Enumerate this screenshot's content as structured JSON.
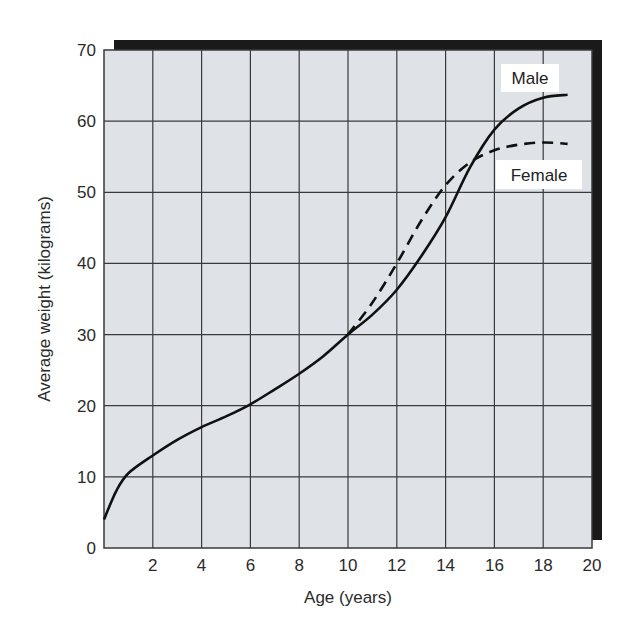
{
  "chart_data": {
    "type": "line",
    "title": "",
    "xlabel": "Age (years)",
    "ylabel": "Average weight (kilograms)",
    "xlim": [
      0,
      20
    ],
    "ylim": [
      0,
      70
    ],
    "xticks": [
      2,
      4,
      6,
      8,
      10,
      12,
      14,
      16,
      18,
      20
    ],
    "yticks": [
      0,
      10,
      20,
      30,
      40,
      50,
      60,
      70
    ],
    "grid": true,
    "legend_position": "inline labels near line ends (upper right)",
    "series": [
      {
        "name": "Male",
        "style": "solid",
        "x": [
          0,
          0.5,
          1,
          2,
          3,
          4,
          5,
          6,
          7,
          8,
          9,
          10,
          11,
          12,
          13,
          14,
          15,
          16,
          17,
          18,
          19
        ],
        "values": [
          4,
          8,
          10.5,
          13,
          15.2,
          17,
          18.5,
          20.2,
          22.3,
          24.5,
          27,
          30,
          32.8,
          36.3,
          41,
          46.5,
          53.5,
          58.8,
          61.8,
          63.3,
          63.7
        ]
      },
      {
        "name": "Female",
        "style": "dashed",
        "x": [
          10,
          11,
          12,
          13,
          14,
          15,
          16,
          17,
          18,
          19
        ],
        "values": [
          30,
          34.5,
          40,
          46,
          51,
          54.2,
          55.9,
          56.7,
          57,
          56.8
        ]
      }
    ],
    "annotations": [
      "Male",
      "Female"
    ]
  },
  "labels": {
    "x_axis": "Age (years)",
    "y_axis": "Average weight (kilograms)",
    "male": "Male",
    "female": "Female"
  },
  "colors": {
    "plot_background": "#dfe3e8",
    "grid": "#3a3a3a",
    "line": "#111111",
    "shadow": "#1a1a1a"
  }
}
